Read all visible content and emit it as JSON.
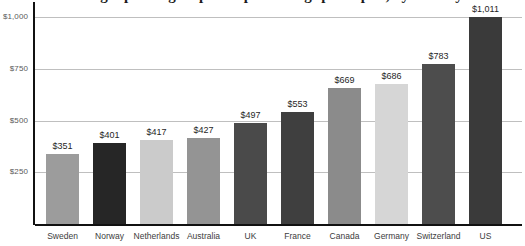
{
  "chart_data": {
    "type": "bar",
    "title": "Average spending on prescription drugs per capita, by country",
    "xlabel": "",
    "ylabel": "",
    "categories": [
      "Sweden",
      "Norway",
      "Netherlands",
      "Australia",
      "UK",
      "France",
      "Canada",
      "Germany",
      "Switzerland",
      "US"
    ],
    "values": [
      351,
      401,
      417,
      427,
      497,
      553,
      669,
      686,
      783,
      1011
    ],
    "value_labels": [
      "$351",
      "$401",
      "$417",
      "$427",
      "$497",
      "$553",
      "$669",
      "$686",
      "$783",
      "$1,011"
    ],
    "bar_colors": [
      "#9c9c9c",
      "#262626",
      "#cbcbcb",
      "#949494",
      "#4a4a4a",
      "#3f3f3f",
      "#8b8b8b",
      "#d6d6d6",
      "#4d4d4d",
      "#3a3a3a"
    ],
    "ylim": [
      0,
      1075
    ],
    "yticks": [
      250,
      500,
      750,
      1000
    ],
    "ytick_labels": [
      "$250",
      "$500",
      "$750",
      "$1,000"
    ],
    "grid": true,
    "legend": "none",
    "axis_color": "#111111",
    "gridline_color": "#bfbfbf",
    "tick_label_color": "#5a5a5a",
    "category_label_color": "#3c3c3c",
    "value_label_color": "#1f1f1f",
    "background_color": "#ffffff"
  }
}
